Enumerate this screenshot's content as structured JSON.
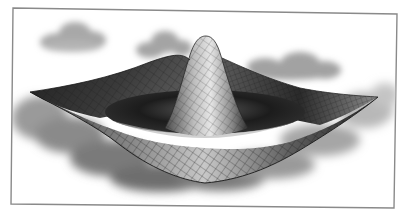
{
  "image": {
    "description": "Grayscale 3D wireframe-mesh surface shaped like a ripple (sinc / Mexican-hat) with a central peak, floating over soft clouds, inside a thin slightly-tilted picture frame",
    "colors": {
      "background": "#ffffff",
      "frame": "#8a8a8a",
      "surface_dark": "#1e1e1e",
      "surface_light": "#d8d8d8",
      "mesh_line": "#2a2a2a",
      "cloud": "#9a9a9a"
    },
    "elements": {
      "frame": "picture-frame",
      "surface": "ripple-surface",
      "peak": "central-peak",
      "clouds": [
        "cloud-top-left",
        "cloud-top-middle",
        "cloud-right",
        "cloud-bank-bottom"
      ]
    }
  }
}
